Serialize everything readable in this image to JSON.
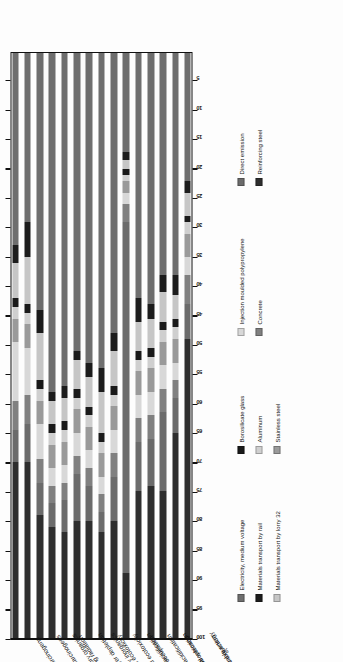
{
  "chart_data": {
    "type": "bar",
    "orientation": "horizontal-stacked",
    "title": "",
    "subtitle": "",
    "xlabel": "%",
    "ylabel": "",
    "xlim": [
      0,
      100
    ],
    "grid": false,
    "stacked": true,
    "stack_total": 100,
    "legend_position": "right",
    "xticks": [
      100,
      95,
      90,
      85,
      80,
      75,
      70,
      65,
      60,
      55,
      50,
      45,
      40,
      35,
      30,
      25,
      20,
      15,
      10,
      5
    ],
    "categories": [
      "Carcinogens",
      "Non - carcinogens",
      "Respiratory organics",
      "Ionizing radiation",
      "Ozone layer depletion",
      "Respiratory inorganics",
      "Aquatic ecotoxicity",
      "Terrestrial ecotoxicity",
      "Terrestrial acidification",
      "Land occupation",
      "Aquatic acidification",
      "Aquatic eutrophication",
      "Global warming",
      "Non - renewable energy",
      "Mineral extraction"
    ],
    "series": [
      {
        "name": "Electricity, medium voltage",
        "color": "#6e6e6e",
        "values": [
          33.0,
          29.0,
          44.0,
          58.0,
          57.0,
          51.0,
          53.0,
          54.0,
          48.0,
          17.0,
          42.0,
          43.0,
          38.0,
          38.0,
          22.0
        ]
      },
      {
        "name": "Materials transport by rail",
        "color": "#1c1c1c",
        "values": [
          3.0,
          6.0,
          4.0,
          1.5,
          2.0,
          1.5,
          2.5,
          4.0,
          3.0,
          1.5,
          4.0,
          2.5,
          3.0,
          3.5,
          2.0
        ]
      },
      {
        "name": "Materials transport by lorry 32",
        "color": "#c6c6c6",
        "values": [
          6.0,
          8.0,
          8.0,
          4.0,
          4.0,
          5.0,
          5.0,
          7.0,
          6.0,
          1.5,
          5.0,
          5.0,
          5.0,
          4.0,
          4.0
        ]
      },
      {
        "name": "Borosilicate glass",
        "color": "#1a1a1a",
        "values": [
          1.5,
          1.5,
          1.5,
          1.5,
          1.5,
          1.5,
          1.5,
          1.5,
          1.5,
          1.0,
          1.5,
          1.5,
          1.5,
          1.5,
          1.0
        ]
      },
      {
        "name": "Aluminum",
        "color": "#cfcfcf",
        "values": [
          2.0,
          2.0,
          2.0,
          2.0,
          2.0,
          2.0,
          2.0,
          2.0,
          2.0,
          1.0,
          2.0,
          2.0,
          2.0,
          2.0,
          2.0
        ]
      },
      {
        "name": "Stainless steel",
        "color": "#9a9a9a",
        "values": [
          4.0,
          4.0,
          4.0,
          4.0,
          4.0,
          4.0,
          4.0,
          4.0,
          4.0,
          2.0,
          4.0,
          4.0,
          4.0,
          4.0,
          4.0
        ]
      },
      {
        "name": "Injection moulded polypropylene",
        "color": "#d8d8d8",
        "values": [
          10.0,
          8.0,
          6.0,
          3.0,
          3.0,
          4.0,
          3.0,
          3.0,
          4.0,
          2.0,
          4.0,
          4.0,
          4.0,
          3.0,
          3.0
        ]
      },
      {
        "name": "Concrete",
        "color": "#808080",
        "values": [
          5.0,
          5.0,
          4.0,
          3.0,
          3.0,
          3.0,
          3.0,
          3.0,
          4.0,
          3.0,
          4.0,
          4.0,
          4.0,
          3.0,
          5.0
        ]
      },
      {
        "name": "Direct emission",
        "color": "#6b6b6b",
        "values": [
          5.5,
          6.5,
          5.5,
          4.0,
          5.5,
          8.0,
          6.0,
          3.5,
          7.5,
          60.0,
          8.5,
          8.0,
          13.5,
          6.0,
          6.0
        ]
      },
      {
        "name": "Reinforcing steel",
        "color": "#2e2e2e",
        "values": [
          30.0,
          30.0,
          21.0,
          19.0,
          18.0,
          20.0,
          20.0,
          18.0,
          20.0,
          11.0,
          25.0,
          26.0,
          25.0,
          35.0,
          51.0
        ]
      }
    ]
  },
  "axis": {
    "x_title": "%"
  },
  "legend": {
    "columns": [
      {
        "items": [
          {
            "label": "Electricity, medium voltage",
            "color": "#6e6e6e"
          },
          {
            "label": "Materials transport by rail",
            "color": "#1c1c1c"
          },
          {
            "label": "Materials transport by lorry 32",
            "color": "#c6c6c6"
          }
        ]
      },
      {
        "items": [
          {
            "label": "Borosilicate glass",
            "color": "#1a1a1a"
          },
          {
            "label": "Aluminum",
            "color": "#cfcfcf"
          },
          {
            "label": "Stainless steel",
            "color": "#9a9a9a"
          }
        ]
      },
      {
        "items": [
          {
            "label": "Injection moulded polypropylene",
            "color": "#d8d8d8"
          },
          {
            "label": "Concrete",
            "color": "#808080"
          }
        ]
      },
      {
        "items": [
          {
            "label": "Direct emission",
            "color": "#6b6b6b"
          },
          {
            "label": "Reinforcing steel",
            "color": "#2e2e2e"
          }
        ]
      }
    ]
  }
}
